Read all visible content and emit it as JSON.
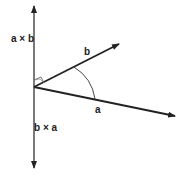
{
  "diagram": {
    "labels": {
      "a_cross_b": "a × b",
      "b_cross_a": "b × a",
      "vector_a": "a",
      "vector_b": "b"
    },
    "colors": {
      "line": "#222222",
      "background": "#ffffff"
    }
  }
}
